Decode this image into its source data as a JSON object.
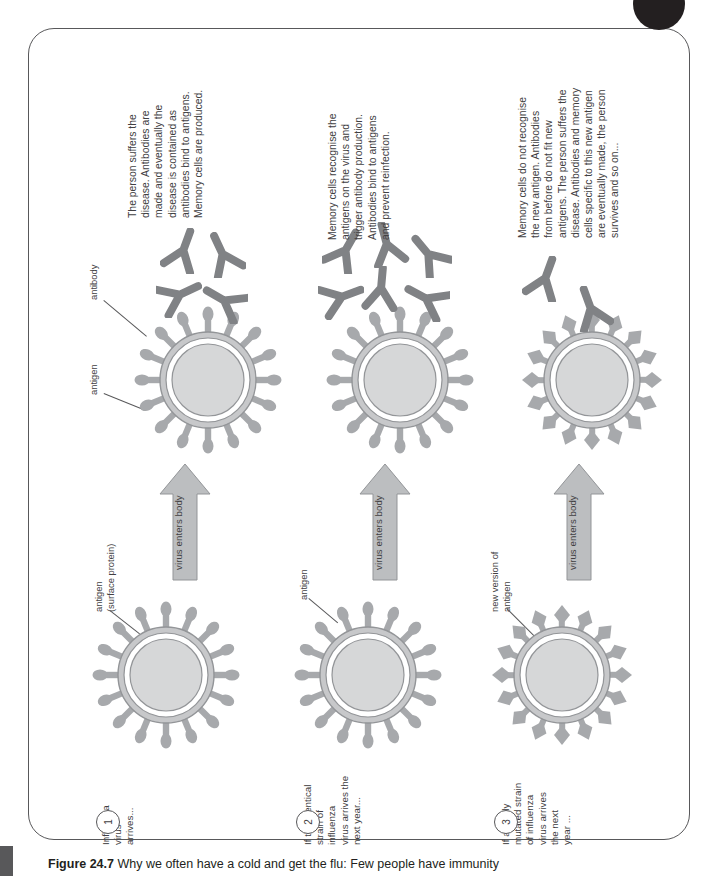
{
  "caption": {
    "figure_label": "Figure 24.7",
    "text": "Why we often have a cold and get the flu: Few people have immunity"
  },
  "colors": {
    "particle_fill": "#d6d7d8",
    "particle_stroke": "#939598",
    "spike_fill": "#a7a9ac",
    "antibody_fill": "#808285",
    "arrow_fill": "#bcbec0",
    "text": "#414042",
    "frame": "#58585a",
    "badge": "#231f20"
  },
  "stages": [
    {
      "number": "1",
      "step_text": "Influenza\nvirus\narrives...",
      "antigen_label": "antigen\n(surface protein)",
      "arrow_label": "virus enters body",
      "antibody_label": "antibody",
      "right_antigen_label": "antigen",
      "description": "The person suffers the\ndisease. Antibodies are\nmade and eventually the\ndisease is contained as\nantibodies bind to antigens.\nMemory cells are produced."
    },
    {
      "number": "2",
      "step_text": "If the identical\nstrain of\ninfluenza\nvirus arrives the\nnext year...",
      "antigen_label": "antigen",
      "arrow_label": "virus enters body",
      "description": "Memory cells recognise the\nantigens on the virus and\ntrigger antibody production.\nAntibodies bind to antigens\nand prevent reinfection."
    },
    {
      "number": "3",
      "step_text": "If a newly\nmutated strain\nof influenza\nvirus arrives\nthe next\nyear ...",
      "antigen_label": "new version of\nantigen",
      "arrow_label": "virus enters body",
      "description": "Memory cells do not recognise\nthe new antigen. Antibodies\nfrom before do not fit new\nantigens. The person suffers the\ndisease. Antibodies and memory\ncells specific to this new antigen\nare eventually made, the person\nsurvives and so on..."
    }
  ]
}
